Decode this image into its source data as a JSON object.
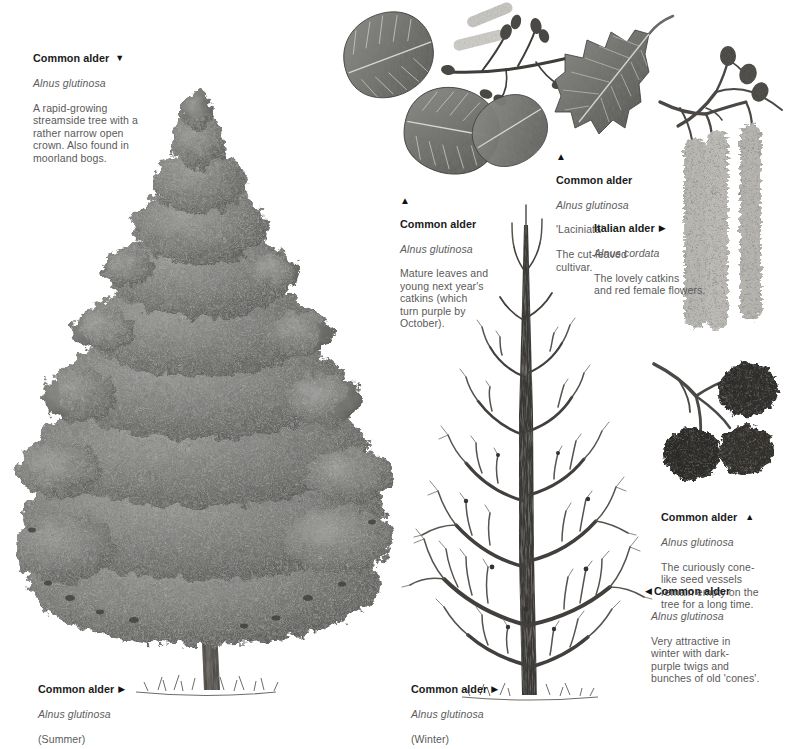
{
  "page": {
    "background_color": "#ffffff",
    "text_color": "#5a5a5a",
    "title_color": "#1b1b1b"
  },
  "captions": {
    "summer_tree_top": {
      "title": "Common alder",
      "marker": "▼",
      "marker_position": "after",
      "species": "Alnus glutinosa",
      "body": "A rapid-growing\nstreamside tree with a\nrather narrow open\ncrown. Also found in\nmoorland bogs."
    },
    "leaves_catkins": {
      "title": "Common alder",
      "marker": "▲",
      "marker_position": "above",
      "species": "Alnus glutinosa",
      "body": "Mature leaves and\nyoung next year's\ncatkins (which\nturn purple by\nOctober)."
    },
    "laciniata": {
      "title": "Common alder",
      "marker": "▲",
      "marker_position": "above",
      "species": "Alnus glutinosa",
      "cultivar": "'Laciniata'",
      "body": "The cut-leaved\ncultivar."
    },
    "italian_alder": {
      "title": "Italian alder",
      "marker": "▶",
      "marker_position": "after",
      "species": "Alnus cordata",
      "body": "The lovely catkins\nand red female flowers."
    },
    "cones": {
      "title": "Common alder",
      "marker": "▲",
      "marker_position": "after",
      "species": "Alnus glutinosa",
      "body": "The curiously cone-\nlike seed vessels\nremain empty on the\ntree for a long time."
    },
    "winter_detail": {
      "title": "Common alder",
      "marker": "◀",
      "marker_position": "before",
      "species": "Alnus glutinosa",
      "body": "Very attractive in\nwinter with dark-\npurple twigs and\nbunches of old 'cones'."
    },
    "summer_label": {
      "title": "Common alder",
      "marker": "▶",
      "marker_position": "after",
      "species": "Alnus glutinosa",
      "body": "(Summer)"
    },
    "winter_label": {
      "title": "Common alder",
      "marker": "▶",
      "marker_position": "after",
      "species": "Alnus glutinosa",
      "body": "(Winter)"
    }
  },
  "illustrations": {
    "summer_tree": {
      "name": "Common alder in summer",
      "season": "Summer"
    },
    "winter_tree": {
      "name": "Common alder in winter",
      "season": "Winter"
    },
    "leaf_spray": {
      "name": "Mature leaves with catkins and buds"
    },
    "laciniata_leaf": {
      "name": "Cut-leaved 'Laciniata' leaf spray"
    },
    "bud_twig": {
      "name": "Twig with young cone-like buds"
    },
    "italian_catkins": {
      "name": "Pendulous catkins of Italian alder"
    },
    "cone_cluster": {
      "name": "Cluster of woody seed cones"
    }
  }
}
